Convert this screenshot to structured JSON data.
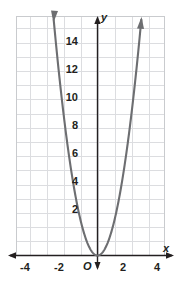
{
  "chart_data": {
    "type": "line",
    "title": "",
    "subtitle": "",
    "xlabel": "x",
    "ylabel": "y",
    "xlim": [
      -4.8,
      4.8
    ],
    "ylim": [
      -1.2,
      16.4
    ],
    "grid": true,
    "grid_step_x": 1,
    "grid_step_y": 1,
    "legend": "none",
    "origin_label": "O",
    "x_tick_labels": [
      "-4",
      "-2",
      "2",
      "4"
    ],
    "x_tick_values": [
      -4,
      -2,
      2,
      4
    ],
    "y_tick_labels": [
      "2",
      "4",
      "6",
      "8",
      "10",
      "12",
      "14"
    ],
    "y_tick_values": [
      2,
      4,
      6,
      8,
      10,
      12,
      14
    ],
    "series": [
      {
        "name": "parabola",
        "equation": "y = 2.5x^2",
        "coefficient_a": 2.5,
        "vertex": [
          0,
          0
        ],
        "color": "#6d6e71",
        "arrow_ends": "both",
        "x": [
          -2.53,
          -2.4,
          -2.2,
          -2.0,
          -1.8,
          -1.6,
          -1.4,
          -1.2,
          -1.0,
          -0.8,
          -0.6,
          -0.4,
          -0.2,
          0,
          0.2,
          0.4,
          0.6,
          0.8,
          1.0,
          1.2,
          1.4,
          1.6,
          1.8,
          2.0,
          2.2,
          2.4,
          2.53
        ],
        "y": [
          16.0,
          14.4,
          12.1,
          10.0,
          8.1,
          6.4,
          4.9,
          3.6,
          2.5,
          1.6,
          0.9,
          0.4,
          0.1,
          0,
          0.1,
          0.4,
          0.9,
          1.6,
          2.5,
          3.6,
          4.9,
          6.4,
          8.1,
          10.0,
          12.1,
          14.4,
          16.0
        ]
      }
    ]
  },
  "colors": {
    "curve": "#6d6e71",
    "axis": "#231f20",
    "grid": "#dcdde0",
    "frame": "#c9cbce",
    "text": "#231f20",
    "background": "#ffffff"
  }
}
